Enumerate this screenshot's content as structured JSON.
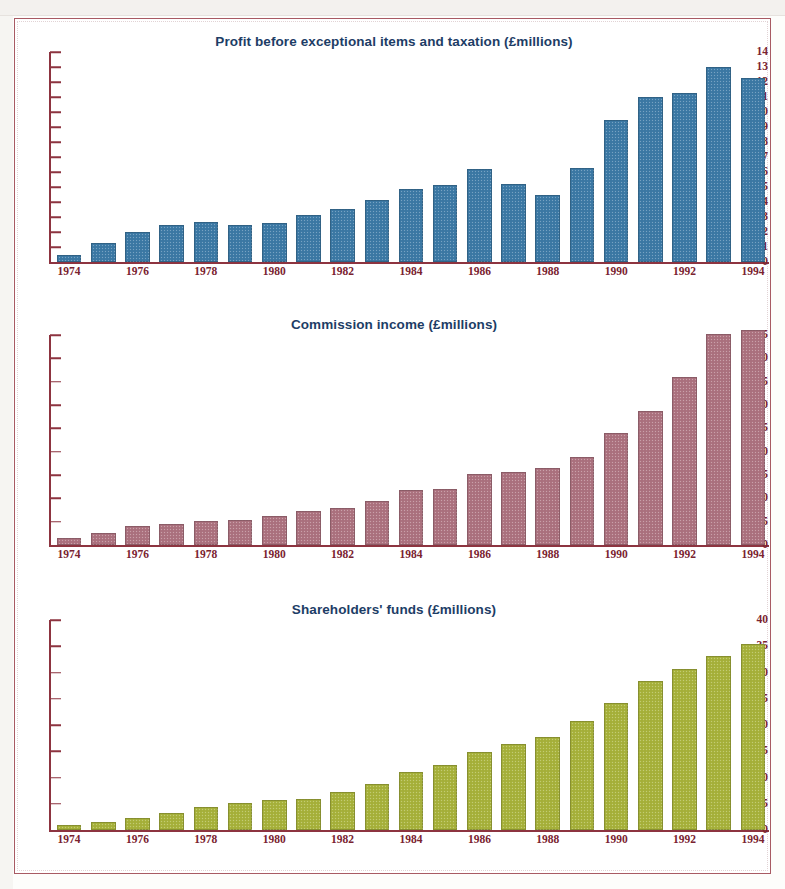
{
  "page": {
    "frame_color": "#a85a63",
    "axis_color": "#8d3440",
    "title_color": "#1d3d66"
  },
  "chart_data": [
    {
      "type": "bar",
      "title": "Profit before exceptional items and taxation (£millions)",
      "xlabel": "",
      "ylabel": "",
      "ylim": [
        0,
        14
      ],
      "ytick_step": 1,
      "yticks": [
        0,
        1,
        2,
        3,
        4,
        5,
        6,
        7,
        8,
        9,
        10,
        11,
        12,
        13,
        14
      ],
      "ytick_labels": [
        "0",
        "1",
        "2",
        "3",
        "4",
        "5",
        "6",
        "7",
        "8",
        "9",
        "10",
        "11",
        "12",
        "13",
        "14"
      ],
      "grid": false,
      "legend": "none",
      "bar_color": "#3d7aa6",
      "categories": [
        "1974",
        "1975",
        "1976",
        "1977",
        "1978",
        "1979",
        "1980",
        "1981",
        "1982",
        "1983",
        "1984",
        "1985",
        "1986",
        "1987",
        "1988",
        "1989",
        "1990",
        "1991",
        "1992",
        "1993",
        "1994"
      ],
      "xtick_labels": [
        "1974",
        "",
        "1976",
        "",
        "1978",
        "",
        "1980",
        "",
        "1982",
        "",
        "1984",
        "",
        "1986",
        "",
        "1988",
        "",
        "1990",
        "",
        "1992",
        "",
        "1994"
      ],
      "values": [
        0.5,
        1.3,
        2.0,
        2.5,
        2.7,
        2.5,
        2.6,
        3.15,
        3.55,
        4.15,
        4.9,
        5.15,
        6.2,
        5.2,
        4.5,
        6.3,
        9.45,
        11.0,
        11.3,
        13.0,
        12.3
      ]
    },
    {
      "type": "bar",
      "title": "Commission income (£millions)",
      "xlabel": "",
      "ylabel": "",
      "ylim": [
        0,
        45
      ],
      "ytick_step": 5,
      "yticks": [
        0,
        5,
        10,
        15,
        20,
        25,
        30,
        35,
        40,
        45
      ],
      "ytick_labels": [
        "0",
        "5",
        "10",
        "15",
        "20",
        "25",
        "30",
        "35",
        "40",
        "45"
      ],
      "grid": false,
      "legend": "none",
      "bar_color": "#ad7380",
      "categories": [
        "1974",
        "1975",
        "1976",
        "1977",
        "1978",
        "1979",
        "1980",
        "1981",
        "1982",
        "1983",
        "1984",
        "1985",
        "1986",
        "1987",
        "1988",
        "1989",
        "1990",
        "1991",
        "1992",
        "1993",
        "1994"
      ],
      "xtick_labels": [
        "1974",
        "",
        "1976",
        "",
        "1978",
        "",
        "1980",
        "",
        "1982",
        "",
        "1984",
        "",
        "1986",
        "",
        "1988",
        "",
        "1990",
        "",
        "1992",
        "",
        "1994"
      ],
      "values": [
        1.4,
        2.6,
        4.0,
        4.6,
        5.1,
        5.3,
        6.3,
        7.3,
        8.0,
        9.4,
        11.7,
        12.0,
        15.2,
        15.6,
        16.5,
        18.8,
        24.1,
        28.8,
        35.9,
        45.2,
        46.0
      ]
    },
    {
      "type": "bar",
      "title": "Shareholders' funds (£millions)",
      "xlabel": "",
      "ylabel": "",
      "ylim": [
        0,
        40
      ],
      "ytick_step": 5,
      "yticks": [
        0,
        5,
        10,
        15,
        20,
        25,
        30,
        35,
        40
      ],
      "ytick_labels": [
        "0",
        "5",
        "10",
        "15",
        "20",
        "25",
        "30",
        "35",
        "40"
      ],
      "grid": false,
      "legend": "none",
      "bar_color": "#a8b33c",
      "categories": [
        "1974",
        "1975",
        "1976",
        "1977",
        "1978",
        "1979",
        "1980",
        "1981",
        "1982",
        "1983",
        "1984",
        "1985",
        "1986",
        "1987",
        "1988",
        "1989",
        "1990",
        "1991",
        "1992",
        "1993",
        "1994"
      ],
      "xtick_labels": [
        "1974",
        "",
        "1976",
        "",
        "1978",
        "",
        "1980",
        "",
        "1982",
        "",
        "1984",
        "",
        "1986",
        "",
        "1988",
        "",
        "1990",
        "",
        "1992",
        "",
        "1994"
      ],
      "values": [
        0.9,
        1.5,
        2.3,
        3.3,
        4.3,
        5.1,
        5.8,
        5.9,
        7.3,
        8.8,
        11.1,
        12.3,
        14.9,
        16.4,
        17.8,
        20.8,
        24.2,
        28.4,
        30.7,
        33.2,
        35.4
      ]
    }
  ]
}
